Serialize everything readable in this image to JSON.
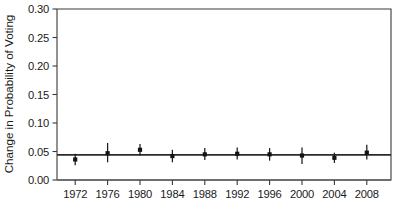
{
  "chart_data": {
    "type": "scatter",
    "title": "",
    "subtitle": "",
    "xlabel": "",
    "ylabel": "Change in Probability of Voting",
    "categories": [
      "1972",
      "1976",
      "1980",
      "1984",
      "1988",
      "1992",
      "1996",
      "2000",
      "2004",
      "2008"
    ],
    "x": [
      1972,
      1976,
      1980,
      1984,
      1988,
      1992,
      1996,
      2000,
      2004,
      2008
    ],
    "values": [
      0.036,
      0.047,
      0.053,
      0.042,
      0.045,
      0.046,
      0.045,
      0.043,
      0.039,
      0.048
    ],
    "error_low": [
      0.026,
      0.031,
      0.043,
      0.031,
      0.035,
      0.036,
      0.034,
      0.028,
      0.03,
      0.036
    ],
    "error_high": [
      0.046,
      0.065,
      0.063,
      0.053,
      0.056,
      0.057,
      0.056,
      0.057,
      0.048,
      0.062
    ],
    "reference_line": 0.044,
    "zero_line": 0.0,
    "ylim": [
      0.0,
      0.3
    ],
    "ytick_values": [
      0.0,
      0.05,
      0.1,
      0.15,
      0.2,
      0.25,
      0.3
    ],
    "ytick_labels": [
      "0.00",
      "0.05",
      "0.10",
      "0.15",
      "0.20",
      "0.25",
      "0.30"
    ],
    "xtick_labels": [
      "1972",
      "1976",
      "1980",
      "1984",
      "1988",
      "1992",
      "1996",
      "2000",
      "2004",
      "2008"
    ],
    "grid": "dotted-zero-only",
    "legend": "none",
    "legend_position": "none",
    "series": [
      {
        "name": "Change in Probability of Voting",
        "values": [
          0.036,
          0.047,
          0.053,
          0.042,
          0.045,
          0.046,
          0.045,
          0.043,
          0.039,
          0.048
        ]
      }
    ],
    "colors": {
      "marker": "#141414",
      "errorbar": "#1c1c1c",
      "reference_line": "#2b2b2b",
      "zero_gridline": "#c9c9c9",
      "axis": "#3a3a3a",
      "background": "#ffffff",
      "text": "#1a1a1a"
    }
  }
}
